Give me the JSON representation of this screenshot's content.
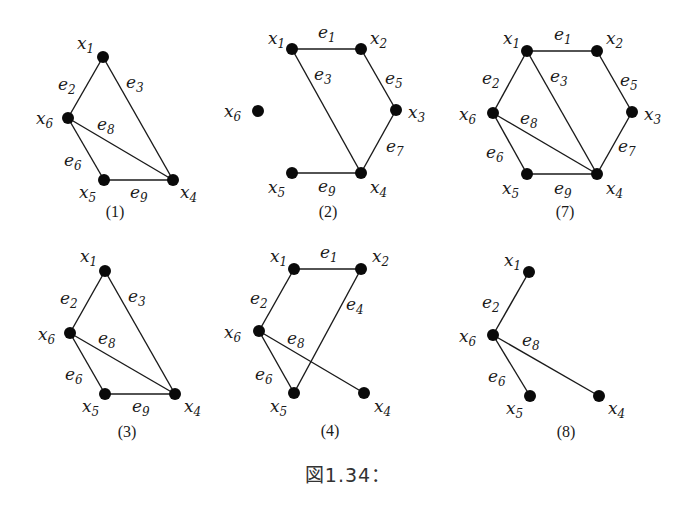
{
  "figure": {
    "caption": "図1.34："
  },
  "graphs": [
    {
      "id": "1",
      "caption": "(1)",
      "caption_pos": [
        115,
        217
      ],
      "nodes": [
        {
          "name": "x",
          "sub": "1",
          "pos": [
            103,
            57
          ],
          "label_pos": [
            77,
            49
          ]
        },
        {
          "name": "x",
          "sub": "6",
          "pos": [
            68,
            118
          ],
          "label_pos": [
            36,
            124
          ]
        },
        {
          "name": "x",
          "sub": "5",
          "pos": [
            104,
            180
          ],
          "label_pos": [
            79,
            198
          ]
        },
        {
          "name": "x",
          "sub": "4",
          "pos": [
            173,
            180
          ],
          "label_pos": [
            180,
            198
          ]
        }
      ],
      "edges": [
        {
          "name": "e",
          "sub": "2",
          "from": 0,
          "to": 1,
          "label_pos": [
            58,
            90
          ]
        },
        {
          "name": "e",
          "sub": "3",
          "from": 0,
          "to": 3,
          "label_pos": [
            126,
            88
          ]
        },
        {
          "name": "e",
          "sub": "8",
          "from": 1,
          "to": 3,
          "label_pos": [
            97,
            130
          ]
        },
        {
          "name": "e",
          "sub": "6",
          "from": 1,
          "to": 2,
          "label_pos": [
            64,
            166
          ]
        },
        {
          "name": "e",
          "sub": "9",
          "from": 2,
          "to": 3,
          "label_pos": [
            130,
            198
          ]
        }
      ]
    },
    {
      "id": "2",
      "caption": "(2)",
      "caption_pos": [
        328,
        217
      ],
      "nodes": [
        {
          "name": "x",
          "sub": "1",
          "pos": [
            292,
            49
          ],
          "label_pos": [
            268,
            44
          ]
        },
        {
          "name": "x",
          "sub": "2",
          "pos": [
            361,
            49
          ],
          "label_pos": [
            370,
            44
          ]
        },
        {
          "name": "x",
          "sub": "3",
          "pos": [
            396,
            110
          ],
          "label_pos": [
            408,
            118
          ]
        },
        {
          "name": "x",
          "sub": "4",
          "pos": [
            361,
            173
          ],
          "label_pos": [
            370,
            193
          ]
        },
        {
          "name": "x",
          "sub": "5",
          "pos": [
            292,
            173
          ],
          "label_pos": [
            268,
            193
          ]
        },
        {
          "name": "x",
          "sub": "6",
          "pos": [
            258,
            111
          ],
          "label_pos": [
            224,
            117
          ]
        }
      ],
      "edges": [
        {
          "name": "e",
          "sub": "1",
          "from": 0,
          "to": 1,
          "label_pos": [
            318,
            38
          ]
        },
        {
          "name": "e",
          "sub": "3",
          "from": 0,
          "to": 3,
          "label_pos": [
            314,
            80
          ]
        },
        {
          "name": "e",
          "sub": "5",
          "from": 1,
          "to": 2,
          "label_pos": [
            385,
            84
          ]
        },
        {
          "name": "e",
          "sub": "7",
          "from": 2,
          "to": 3,
          "label_pos": [
            386,
            152
          ]
        },
        {
          "name": "e",
          "sub": "9",
          "from": 4,
          "to": 3,
          "label_pos": [
            318,
            192
          ]
        }
      ]
    },
    {
      "id": "7",
      "caption": "(7)",
      "caption_pos": [
        565,
        217
      ],
      "nodes": [
        {
          "name": "x",
          "sub": "1",
          "pos": [
            527,
            51
          ],
          "label_pos": [
            503,
            44
          ]
        },
        {
          "name": "x",
          "sub": "2",
          "pos": [
            597,
            51
          ],
          "label_pos": [
            606,
            44
          ]
        },
        {
          "name": "x",
          "sub": "3",
          "pos": [
            632,
            112
          ],
          "label_pos": [
            644,
            120
          ]
        },
        {
          "name": "x",
          "sub": "4",
          "pos": [
            597,
            174
          ],
          "label_pos": [
            606,
            194
          ]
        },
        {
          "name": "x",
          "sub": "5",
          "pos": [
            527,
            174
          ],
          "label_pos": [
            502,
            194
          ]
        },
        {
          "name": "x",
          "sub": "6",
          "pos": [
            493,
            113
          ],
          "label_pos": [
            459,
            120
          ]
        }
      ],
      "edges": [
        {
          "name": "e",
          "sub": "1",
          "from": 0,
          "to": 1,
          "label_pos": [
            554,
            40
          ]
        },
        {
          "name": "e",
          "sub": "2",
          "from": 0,
          "to": 5,
          "label_pos": [
            482,
            84
          ]
        },
        {
          "name": "e",
          "sub": "3",
          "from": 0,
          "to": 3,
          "label_pos": [
            550,
            82
          ]
        },
        {
          "name": "e",
          "sub": "5",
          "from": 1,
          "to": 2,
          "label_pos": [
            620,
            86
          ]
        },
        {
          "name": "e",
          "sub": "8",
          "from": 5,
          "to": 3,
          "label_pos": [
            520,
            124
          ]
        },
        {
          "name": "e",
          "sub": "7",
          "from": 2,
          "to": 3,
          "label_pos": [
            618,
            152
          ]
        },
        {
          "name": "e",
          "sub": "6",
          "from": 5,
          "to": 4,
          "label_pos": [
            486,
            158
          ]
        },
        {
          "name": "e",
          "sub": "9",
          "from": 4,
          "to": 3,
          "label_pos": [
            554,
            194
          ]
        }
      ]
    },
    {
      "id": "3",
      "caption": "(3)",
      "caption_pos": [
        127,
        437
      ],
      "nodes": [
        {
          "name": "x",
          "sub": "1",
          "pos": [
            105,
            271
          ],
          "label_pos": [
            80,
            262
          ]
        },
        {
          "name": "x",
          "sub": "6",
          "pos": [
            70,
            333
          ],
          "label_pos": [
            38,
            340
          ]
        },
        {
          "name": "x",
          "sub": "5",
          "pos": [
            105,
            394
          ],
          "label_pos": [
            82,
            412
          ]
        },
        {
          "name": "x",
          "sub": "4",
          "pos": [
            175,
            394
          ],
          "label_pos": [
            184,
            412
          ]
        }
      ],
      "edges": [
        {
          "name": "e",
          "sub": "2",
          "from": 0,
          "to": 1,
          "label_pos": [
            60,
            304
          ]
        },
        {
          "name": "e",
          "sub": "3",
          "from": 0,
          "to": 3,
          "label_pos": [
            128,
            302
          ]
        },
        {
          "name": "e",
          "sub": "8",
          "from": 1,
          "to": 3,
          "label_pos": [
            98,
            344
          ]
        },
        {
          "name": "e",
          "sub": "6",
          "from": 1,
          "to": 2,
          "label_pos": [
            65,
            380
          ]
        },
        {
          "name": "e",
          "sub": "9",
          "from": 2,
          "to": 3,
          "label_pos": [
            132,
            412
          ]
        }
      ]
    },
    {
      "id": "4",
      "caption": "(4)",
      "caption_pos": [
        330,
        436
      ],
      "nodes": [
        {
          "name": "x",
          "sub": "1",
          "pos": [
            294,
            269
          ],
          "label_pos": [
            270,
            262
          ]
        },
        {
          "name": "x",
          "sub": "2",
          "pos": [
            361,
            269
          ],
          "label_pos": [
            372,
            262
          ]
        },
        {
          "name": "x",
          "sub": "6",
          "pos": [
            259,
            331
          ],
          "label_pos": [
            224,
            338
          ]
        },
        {
          "name": "x",
          "sub": "5",
          "pos": [
            294,
            393
          ],
          "label_pos": [
            270,
            412
          ]
        },
        {
          "name": "x",
          "sub": "4",
          "pos": [
            364,
            393
          ],
          "label_pos": [
            374,
            412
          ]
        }
      ],
      "edges": [
        {
          "name": "e",
          "sub": "1",
          "from": 0,
          "to": 1,
          "label_pos": [
            320,
            258
          ]
        },
        {
          "name": "e",
          "sub": "2",
          "from": 0,
          "to": 2,
          "label_pos": [
            250,
            304
          ]
        },
        {
          "name": "e",
          "sub": "4",
          "from": 1,
          "to": 3,
          "label_pos": [
            346,
            310
          ]
        },
        {
          "name": "e",
          "sub": "8",
          "from": 2,
          "to": 4,
          "label_pos": [
            287,
            344
          ]
        },
        {
          "name": "e",
          "sub": "6",
          "from": 2,
          "to": 3,
          "label_pos": [
            255,
            380
          ]
        }
      ]
    },
    {
      "id": "8",
      "caption": "(8)",
      "caption_pos": [
        566,
        437
      ],
      "nodes": [
        {
          "name": "x",
          "sub": "1",
          "pos": [
            529,
            272
          ],
          "label_pos": [
            504,
            266
          ]
        },
        {
          "name": "x",
          "sub": "6",
          "pos": [
            493,
            335
          ],
          "label_pos": [
            459,
            342
          ]
        },
        {
          "name": "x",
          "sub": "5",
          "pos": [
            530,
            396
          ],
          "label_pos": [
            506,
            414
          ]
        },
        {
          "name": "x",
          "sub": "4",
          "pos": [
            599,
            396
          ],
          "label_pos": [
            608,
            414
          ]
        }
      ],
      "edges": [
        {
          "name": "e",
          "sub": "2",
          "from": 0,
          "to": 1,
          "label_pos": [
            482,
            308
          ]
        },
        {
          "name": "e",
          "sub": "8",
          "from": 1,
          "to": 3,
          "label_pos": [
            522,
            346
          ]
        },
        {
          "name": "e",
          "sub": "6",
          "from": 1,
          "to": 2,
          "label_pos": [
            488,
            382
          ]
        }
      ]
    }
  ]
}
